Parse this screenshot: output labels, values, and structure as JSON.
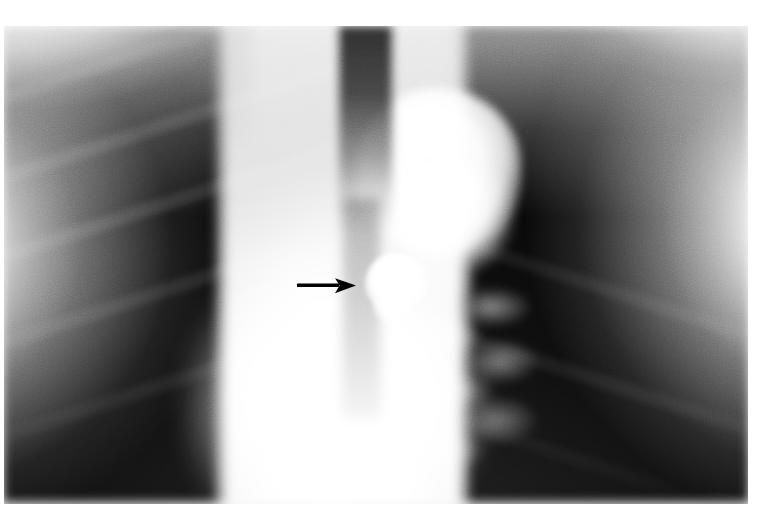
{
  "figure": {
    "kind": "chest-radiograph",
    "modality": "plain-film-x-ray",
    "projection": "frontal-pa",
    "caption": "",
    "page_background": "#ffffff",
    "plate": {
      "x": 4,
      "y": 26,
      "width": 744,
      "height": 478,
      "tone_dark": "#050505",
      "tone_bright": "#ffffff"
    }
  },
  "annotations": [
    {
      "id": "lesion-arrow",
      "shape": "arrow",
      "direction": "right",
      "color": "#000000",
      "label": "",
      "x": 294,
      "y": 272,
      "width": 68,
      "height": 28,
      "points_to": "calcified-nodule"
    }
  ],
  "anatomy": [
    {
      "id": "right-lung-field",
      "label": "right lung field",
      "tone": "radiolucent-dark"
    },
    {
      "id": "left-lung-field",
      "label": "left lung field",
      "tone": "radiolucent-dark"
    },
    {
      "id": "mediastinum",
      "label": "mediastinum",
      "tone": "radiopaque-bright"
    },
    {
      "id": "trachea",
      "label": "tracheal air column",
      "tone": "dark-stripe"
    },
    {
      "id": "aortic-mass",
      "label": "aortic arch / mediastinal mass",
      "tone": "radiopaque-bright"
    },
    {
      "id": "hilar-markings",
      "label": "hilar and pulmonary vascular markings",
      "tone": "mottled-grey"
    },
    {
      "id": "calcified-nodule",
      "label": "calcified nodule",
      "tone": "very-bright"
    },
    {
      "id": "chest-wall-soft-tissue",
      "label": "chest wall soft tissue",
      "tone": "bright-margin"
    }
  ]
}
